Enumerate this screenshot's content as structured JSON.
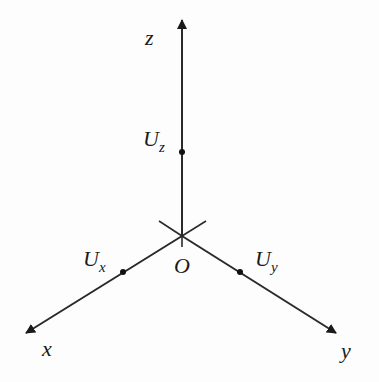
{
  "diagram": {
    "type": "3D coordinate axes",
    "colors": {
      "axis": "#2a2a2a",
      "background": "#fdfdfd"
    },
    "origin": {
      "label": "O"
    },
    "axes": [
      {
        "id": "z",
        "label": "z",
        "direction": "up"
      },
      {
        "id": "x",
        "label": "x",
        "direction": "lower-left"
      },
      {
        "id": "y",
        "label": "y",
        "direction": "lower-right"
      }
    ],
    "points": [
      {
        "id": "Uz",
        "base": "U",
        "sub": "z",
        "axis": "z"
      },
      {
        "id": "Ux",
        "base": "U",
        "sub": "x",
        "axis": "x"
      },
      {
        "id": "Uy",
        "base": "U",
        "sub": "y",
        "axis": "y"
      }
    ]
  }
}
